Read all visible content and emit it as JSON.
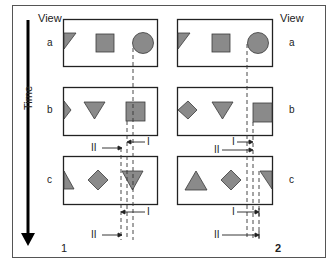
{
  "figure": {
    "time_label": "Time",
    "view_label_left": "View",
    "view_label_right": "View",
    "panels": [
      {
        "id": "1",
        "label": "1"
      },
      {
        "id": "2",
        "label": "2"
      }
    ],
    "rows": [
      {
        "id": "a",
        "label": "a"
      },
      {
        "id": "b",
        "label": "b"
      },
      {
        "id": "c",
        "label": "c"
      }
    ],
    "markers": {
      "I": "I",
      "II": "II"
    },
    "shape_fill": "#8a8a8a",
    "shape_stroke": "#3a3a3a",
    "frame_stroke": "#222222",
    "panel1_shapes": {
      "a": [
        "triangle-down-clipped",
        "square",
        "circle"
      ],
      "b": [
        "triangle-right-clipped",
        "triangle-down",
        "square"
      ],
      "c": [
        "triangle-up-clipped",
        "diamond",
        "triangle-down"
      ]
    },
    "panel2_shapes": {
      "a": [
        "triangle-down-clipped",
        "square",
        "circle"
      ],
      "b": [
        "diamond",
        "triangle-down",
        "square-clipped"
      ],
      "c": [
        "triangle-up",
        "diamond",
        "triangle-down-clipped"
      ]
    }
  }
}
